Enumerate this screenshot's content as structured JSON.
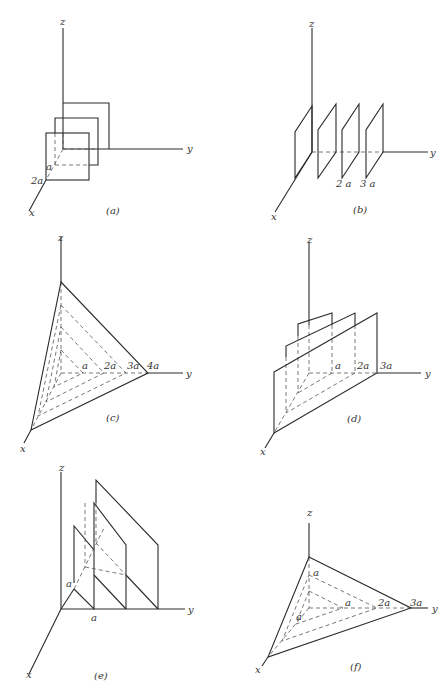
{
  "figure": {
    "panels": [
      {
        "id": "a",
        "caption": "(a)",
        "axes": {
          "x": "x",
          "y": "y",
          "z": "z"
        },
        "tick_labels": [
          "a",
          "2a"
        ],
        "description": "Three parallel square planes perpendicular to the x-axis at x = 0, a, 2a"
      },
      {
        "id": "b",
        "caption": "(b)",
        "axes": {
          "x": "x",
          "y": "y",
          "z": "z"
        },
        "tick_labels": [
          "2 a",
          "3 a"
        ],
        "description": "Four parallel planes perpendicular to the y-axis at y = 0, a, 2a, 3a"
      },
      {
        "id": "c",
        "caption": "(c)",
        "axes": {
          "x": "x",
          "y": "y",
          "z": "z"
        },
        "tick_labels": [
          "a",
          "2a",
          "3a",
          "4a"
        ],
        "description": "Family of parallel triangular planes x+y+z = na, n = 1..4"
      },
      {
        "id": "d",
        "caption": "(d)",
        "axes": {
          "x": "x",
          "y": "y",
          "z": "z"
        },
        "tick_labels": [
          "a",
          "2a",
          "3a"
        ],
        "description": "Parallel planes x + y = na, n = 1..3, parallel to z-axis"
      },
      {
        "id": "e",
        "caption": "(e)",
        "axes": {
          "x": "x",
          "y": "y",
          "z": "z"
        },
        "tick_labels": [
          "a",
          "a"
        ],
        "description": "Parallel planes y - x = na type, intercepts spaced a on y-axis"
      },
      {
        "id": "f",
        "caption": "(f)",
        "axes": {
          "x": "x",
          "y": "y",
          "z": "z"
        },
        "tick_labels": [
          "a",
          "a",
          "a",
          "2a",
          "3a"
        ],
        "description": "Family of parallel planes with intercepts (a, 3a, a) scaled"
      }
    ]
  }
}
